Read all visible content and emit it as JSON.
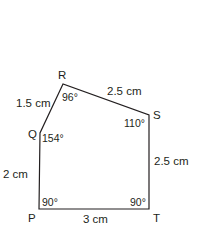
{
  "figure": {
    "type": "pentagon",
    "vertices": [
      {
        "name": "P",
        "angle": "90°"
      },
      {
        "name": "Q",
        "angle": "154°"
      },
      {
        "name": "R",
        "angle": "96°"
      },
      {
        "name": "S",
        "angle": "110°"
      },
      {
        "name": "T",
        "angle": "90°"
      }
    ],
    "sides": {
      "PQ": "2 cm",
      "QR": "1.5 cm",
      "RS": "2.5 cm",
      "ST": "2.5 cm",
      "TP": "3 cm"
    }
  }
}
